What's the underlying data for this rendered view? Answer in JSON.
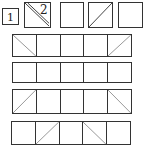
{
  "top_row": [
    {
      "label": "1",
      "diagonal": "none"
    },
    {
      "label": "2",
      "diagonal": "double-down"
    },
    {
      "label": "",
      "diagonal": "none"
    },
    {
      "label": "",
      "diagonal": "up"
    },
    {
      "label": "",
      "diagonal": "none"
    }
  ],
  "grid_rows": [
    [
      "down",
      "none",
      "none",
      "none",
      "up"
    ],
    [
      "none",
      "none",
      "none",
      "none",
      "none"
    ],
    [
      "up",
      "none",
      "none",
      "none",
      "down"
    ],
    [
      "none",
      "up",
      "none",
      "down",
      "none"
    ]
  ],
  "colors": {
    "line": "#333333",
    "background": "#ffffff"
  }
}
